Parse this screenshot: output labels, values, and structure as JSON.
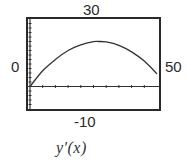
{
  "window": {
    "xmin_label": "0",
    "xmax_label": "50",
    "ymax_label": "30",
    "ymin_label": "-10"
  },
  "caption": "y'(x)",
  "chart_data": {
    "type": "line",
    "title": "y'(x)",
    "xlabel": "",
    "ylabel": "",
    "xlim": [
      0,
      50
    ],
    "ylim": [
      -10,
      30
    ],
    "grid": false,
    "x_tick_step": 5,
    "y_tick_step": 2,
    "axes_style": "graphing-calculator window (Xmin/Xmax shown left/right, Ymax/Ymin shown top/bottom)",
    "series": [
      {
        "name": "y'(x)",
        "x": [
          0,
          5,
          10,
          15,
          20,
          25,
          27,
          30,
          35,
          40,
          45,
          50
        ],
        "values": [
          0,
          7,
          12,
          16,
          18.5,
          19.9,
          20,
          19.8,
          18.3,
          15.4,
          11.3,
          5.6
        ]
      }
    ]
  },
  "colors": {
    "frame": "#2a2a2a",
    "curve": "#333333",
    "axis": "#333333",
    "background": "#ffffff"
  }
}
